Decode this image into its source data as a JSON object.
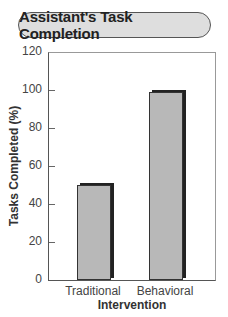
{
  "chart_data": {
    "type": "bar",
    "title": "Assistant's Task Completion",
    "categories": [
      "Traditional",
      "Behavioral"
    ],
    "values": [
      50,
      99
    ],
    "xlabel": "Intervention",
    "ylabel": "Tasks Completed (%)",
    "ylim": [
      0,
      120
    ],
    "yticks": [
      0,
      20,
      40,
      60,
      80,
      100,
      120
    ],
    "grid": false,
    "legend": null,
    "bar_color": "#b8b8b8",
    "bar_edge_color": "#222222",
    "title_box_color": "#dedede"
  },
  "labels": {
    "title": "Assistant's Task Completion",
    "xlabel": "Intervention",
    "ylabel": "Tasks Completed (%)",
    "yticks": [
      "0",
      "20",
      "40",
      "60",
      "80",
      "100",
      "120"
    ],
    "categories": [
      "Traditional",
      "Behavioral"
    ]
  }
}
